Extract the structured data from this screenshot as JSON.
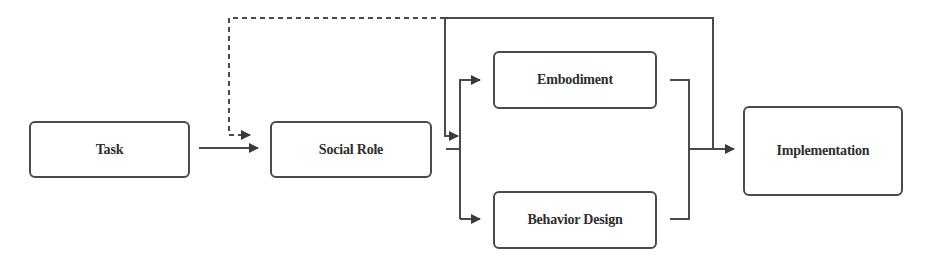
{
  "diagram": {
    "type": "flowchart",
    "colors": {
      "stroke": "#4a4a4a",
      "text": "#2e2e2e",
      "background": "#ffffff"
    },
    "nodes": {
      "task": {
        "label": "Task"
      },
      "social_role": {
        "label": "Social Role"
      },
      "embodiment": {
        "label": "Embodiment"
      },
      "behavior_design": {
        "label": "Behavior Design"
      },
      "implementation": {
        "label": "Implementation"
      }
    },
    "edges": [
      {
        "from": "Task",
        "to": "Social Role",
        "style": "solid"
      },
      {
        "from": "Social Role",
        "to": "Embodiment",
        "style": "solid"
      },
      {
        "from": "Social Role",
        "to": "Behavior Design",
        "style": "solid"
      },
      {
        "from": "Embodiment",
        "to": "Implementation",
        "style": "solid"
      },
      {
        "from": "Behavior Design",
        "to": "Implementation",
        "style": "solid"
      },
      {
        "from": "Implementation",
        "to": "Embodiment / Behavior Design (feedback)",
        "style": "solid"
      },
      {
        "from": "Implementation",
        "to": "Social Role (feedback)",
        "style": "dashed"
      }
    ]
  }
}
